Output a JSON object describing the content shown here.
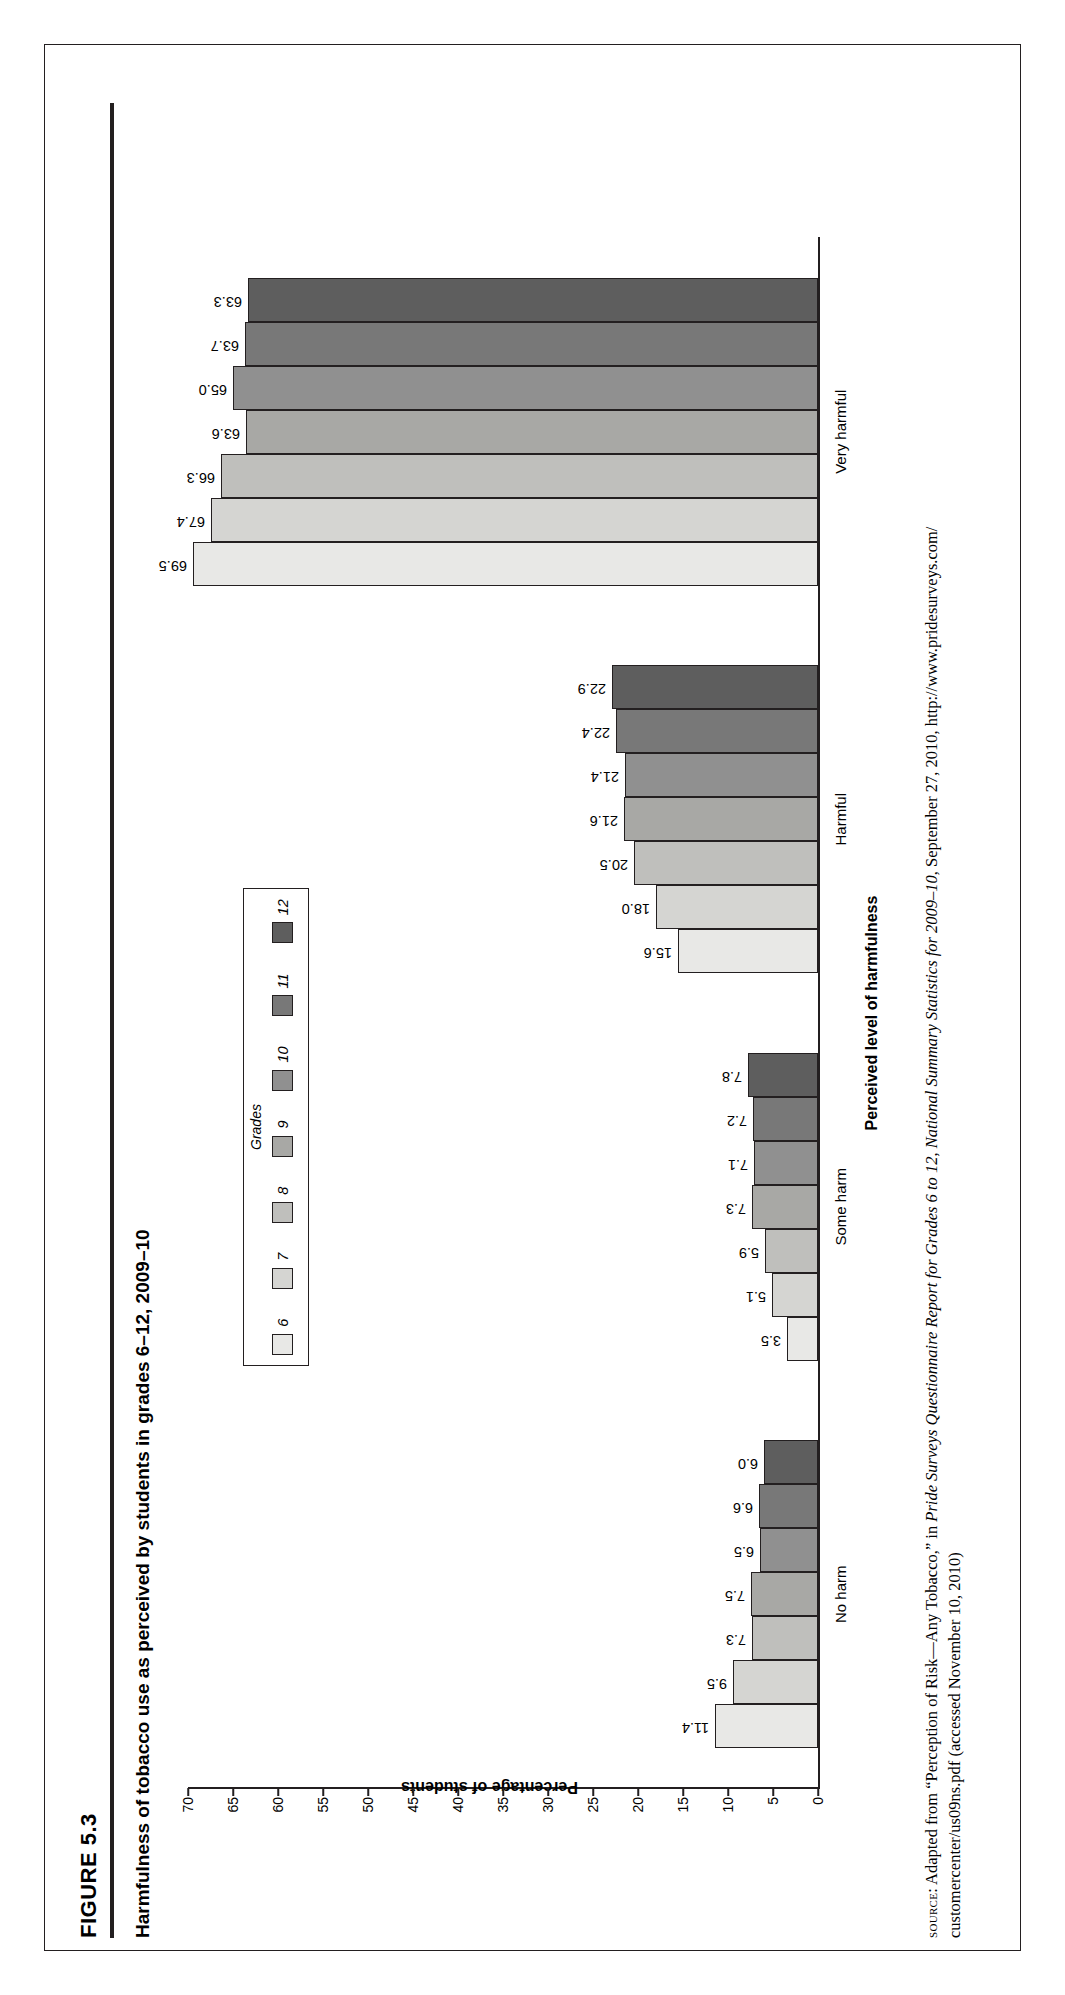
{
  "figure": {
    "number": "FIGURE 5.3",
    "title": "Harmfulness of tobacco use as perceived by students in grades 6–12, 2009–10"
  },
  "legend": {
    "title": "Grades",
    "items": [
      {
        "label": "6",
        "color": "#e8e8e6"
      },
      {
        "label": "7",
        "color": "#d5d5d2"
      },
      {
        "label": "8",
        "color": "#bfbfbc"
      },
      {
        "label": "9",
        "color": "#a8a8a5"
      },
      {
        "label": "10",
        "color": "#909090"
      },
      {
        "label": "11",
        "color": "#787878"
      },
      {
        "label": "12",
        "color": "#5e5e5e"
      }
    ]
  },
  "source": {
    "prefix": "source",
    "line1_a": ": Adapted from “Perception of Risk—Any Tobacco,” in ",
    "line1_i": "Pride Surveys Questionnaire Report for Grades 6 to 12, National Summary Statistics for 2009–10",
    "line1_b": ", September 27, 2010, http://www.pridesurveys.com/",
    "line2": "customercenter/us09ns.pdf (accessed November 10, 2010)"
  },
  "chart_data": {
    "type": "bar",
    "title": "Harmfulness of tobacco use as perceived by students in grades 6–12, 2009–10",
    "xlabel": "Perceived level of harmfulness",
    "ylabel": "Percentage of students",
    "ylim": [
      0,
      70
    ],
    "yticks": [
      "0",
      "5",
      "10",
      "15",
      "20",
      "25",
      "30",
      "35",
      "40",
      "45",
      "50",
      "55",
      "60",
      "65",
      "70"
    ],
    "grid": false,
    "legend_position": "top-center",
    "categories": [
      "No harm",
      "Some harm",
      "Harmful",
      "Very harmful"
    ],
    "series": [
      {
        "name": "6",
        "values": [
          11.4,
          3.5,
          15.6,
          69.5
        ]
      },
      {
        "name": "7",
        "values": [
          9.5,
          5.1,
          18.0,
          67.4
        ]
      },
      {
        "name": "8",
        "values": [
          7.3,
          5.9,
          20.5,
          66.3
        ]
      },
      {
        "name": "9",
        "values": [
          7.5,
          7.3,
          21.6,
          63.6
        ]
      },
      {
        "name": "10",
        "values": [
          6.5,
          7.1,
          21.4,
          65.0
        ]
      },
      {
        "name": "11",
        "values": [
          6.6,
          7.2,
          22.4,
          63.7
        ]
      },
      {
        "name": "12",
        "values": [
          6.0,
          7.8,
          22.9,
          63.3
        ]
      }
    ],
    "value_labels": {
      "No harm": [
        "11.4",
        "9.5",
        "7.3",
        "7.5",
        "6.5",
        "6.6",
        "6.0"
      ],
      "Some harm": [
        "3.5",
        "5.1",
        "5.9",
        "7.3",
        "7.1",
        "7.2",
        "7.8"
      ],
      "Harmful": [
        "15.6",
        "18.0",
        "20.5",
        "21.6",
        "21.4",
        "22.4",
        "22.9"
      ],
      "Very harmful": [
        "69.5",
        "67.4",
        "66.3",
        "63.6",
        "65.0",
        "63.7",
        "63.3"
      ]
    }
  }
}
